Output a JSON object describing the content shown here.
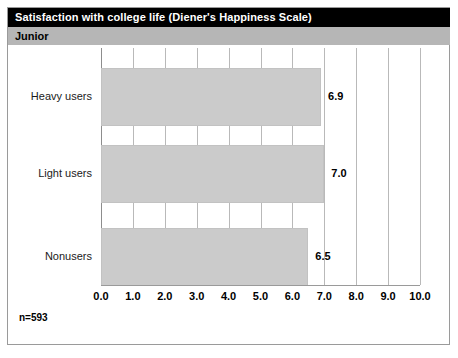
{
  "header": {
    "title": "Satisfaction with college life (Diener's Happiness Scale)",
    "subtitle": "Junior"
  },
  "footer": {
    "sample_size": "n=593"
  },
  "colors": {
    "title_bar_bg": "#000000",
    "title_bar_text": "#ffffff",
    "subtitle_bar_bg": "#b6b6b6",
    "bar_fill": "#cbcbcb",
    "gridline": "#b9b9b9",
    "frame_border": "#9a9a9a"
  },
  "chart_data": {
    "type": "bar",
    "orientation": "horizontal",
    "title": "Satisfaction with college life (Diener's Happiness Scale)",
    "subtitle": "Junior",
    "categories": [
      "Heavy users",
      "Light users",
      "Nonusers"
    ],
    "values": [
      6.9,
      7.0,
      6.5
    ],
    "value_labels": [
      "6.9",
      "7.0",
      "6.5"
    ],
    "xlabel": "",
    "ylabel": "",
    "xlim": [
      0.0,
      10.0
    ],
    "xticks": [
      0.0,
      1.0,
      2.0,
      3.0,
      4.0,
      5.0,
      6.0,
      7.0,
      8.0,
      9.0,
      10.0
    ],
    "xtick_labels": [
      "0.0",
      "1.0",
      "2.0",
      "3.0",
      "4.0",
      "5.0",
      "6.0",
      "7.0",
      "8.0",
      "9.0",
      "10.0"
    ],
    "grid": true,
    "grid_axis": "x",
    "legend": false,
    "annotation": "n=593"
  }
}
